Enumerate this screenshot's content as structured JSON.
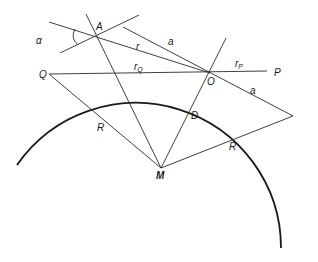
{
  "figure": {
    "type": "geometry-diagram",
    "points": {
      "A": {
        "label": "A",
        "x": 97,
        "y": 37
      },
      "O": {
        "label": "O",
        "x": 210,
        "y": 73
      },
      "P": {
        "label": "P",
        "x": 267,
        "y": 71
      },
      "Q": {
        "label": "Q",
        "x": 49,
        "y": 74
      },
      "M": {
        "label": "M",
        "x": 161,
        "y": 168
      }
    },
    "labels": {
      "alpha": "α",
      "A": "A",
      "r": "r",
      "a_top": "a",
      "r_Q_main": "r",
      "r_Q_sub": "Q",
      "O": "O",
      "r_P_main": "r",
      "r_P_sub": "P",
      "P": "P",
      "a_right": "a",
      "Q": "Q",
      "R_left": "R",
      "D": "D",
      "M": "M",
      "R_right": "R"
    }
  }
}
